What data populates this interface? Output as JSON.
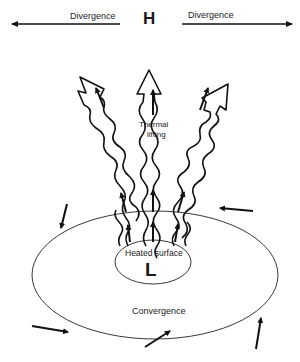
{
  "diagram": {
    "title_marker_high": "H",
    "title_marker_low": "L",
    "labels": {
      "divergence_left": "Divergence",
      "divergence_right": "Divergence",
      "thermal_line1": "Thermal",
      "thermal_line2": "lifting",
      "heated_surface": "Heated surface",
      "convergence": "Convergence"
    },
    "colors": {
      "ink": "#111111",
      "background": "#ffffff",
      "caption": "#9a9a9a"
    },
    "elements": {
      "rising_columns": [
        "left-column",
        "center-column",
        "right-column"
      ],
      "surface_wind_arrows": [
        "upper-left-inflow",
        "upper-right-inflow",
        "lower-left-inflow",
        "bottom-inflow",
        "lower-right-inflow"
      ],
      "divergence_arrows": [
        "left-outflow",
        "right-outflow"
      ]
    }
  }
}
